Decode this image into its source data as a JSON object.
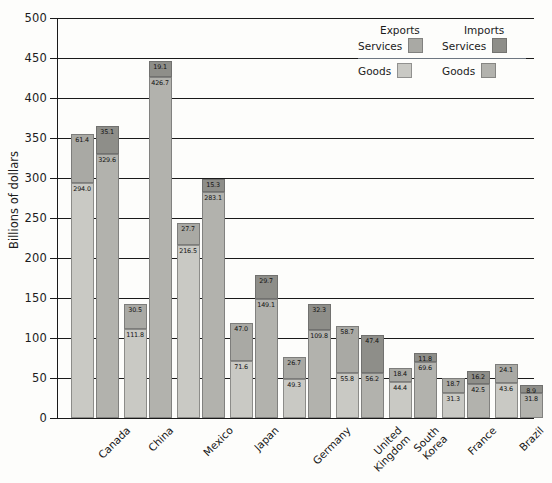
{
  "chart_data": {
    "type": "bar",
    "subtype": "grouped-stacked-bar",
    "title": "",
    "xlabel": "",
    "ylabel": "Billions of dollars",
    "ylim": [
      0,
      500
    ],
    "ytick_step": 50,
    "yticks": [
      0,
      50,
      100,
      150,
      200,
      250,
      300,
      350,
      400,
      450,
      500
    ],
    "ytick_labels": [
      "0",
      "50",
      "100",
      "150",
      "200",
      "250",
      "300",
      "350",
      "400",
      "450",
      "500"
    ],
    "grid": true,
    "grid_axis": "y",
    "legend_position": "top-right",
    "categories": [
      "Canada",
      "China",
      "Mexico",
      "Japan",
      "Germany",
      "United\nKingdom",
      "South\nKorea",
      "France",
      "Brazil"
    ],
    "series": [
      {
        "name": "Exports Goods",
        "group": "Exports",
        "part": "Goods",
        "color": "#c9c9c4",
        "values": [
          294.0,
          111.8,
          216.5,
          71.6,
          49.3,
          55.8,
          44.4,
          31.3,
          43.6
        ]
      },
      {
        "name": "Exports Services",
        "group": "Exports",
        "part": "Services",
        "color": "#a9a9a4",
        "values": [
          61.4,
          30.5,
          27.7,
          47.0,
          26.7,
          58.7,
          18.4,
          18.7,
          24.1
        ]
      },
      {
        "name": "Imports Goods",
        "group": "Imports",
        "part": "Goods",
        "color": "#b2b2ad",
        "values": [
          329.6,
          426.7,
          283.1,
          149.1,
          109.8,
          56.2,
          69.6,
          42.5,
          31.8
        ]
      },
      {
        "name": "Imports Services",
        "group": "Imports",
        "part": "Services",
        "color": "#8e8e89",
        "values": [
          35.1,
          19.1,
          15.3,
          29.7,
          32.3,
          47.4,
          11.8,
          16.2,
          8.9
        ]
      }
    ],
    "data_labels": {
      "Canada": {
        "exports_goods": "294.0",
        "exports_services": "61.4",
        "imports_goods": "329.6",
        "imports_services": "35.1"
      },
      "China": {
        "exports_goods": "111.8",
        "exports_services": "30.5",
        "imports_goods": "426.7",
        "imports_services": "19.1"
      },
      "Mexico": {
        "exports_goods": "216.5",
        "exports_services": "27.7",
        "imports_goods": "283.1",
        "imports_services": "15.3"
      },
      "Japan": {
        "exports_goods": "71.6",
        "exports_services": "47.0",
        "imports_goods": "149.1",
        "imports_services": "29.7"
      },
      "Germany": {
        "exports_goods": "49.3",
        "exports_services": "26.7",
        "imports_goods": "109.8",
        "imports_services": "32.3"
      },
      "United Kingdom": {
        "exports_goods": "55.8",
        "exports_services": "58.7",
        "imports_goods": "56.2",
        "imports_services": "47.4"
      },
      "South Korea": {
        "exports_goods": "44.4",
        "exports_services": "18.4",
        "imports_goods": "69.6",
        "imports_services": "11.8"
      },
      "France": {
        "exports_goods": "31.3",
        "exports_services": "18.7",
        "imports_goods": "42.5",
        "imports_services": "16.2"
      },
      "Brazil": {
        "exports_goods": "43.6",
        "exports_services": "24.1",
        "imports_goods": "31.8",
        "imports_services": "8.9"
      }
    }
  },
  "legend": {
    "exports_header": "Exports",
    "imports_header": "Imports",
    "services_label_left": "Services",
    "services_label_right": "Services",
    "goods_label_left": "Goods",
    "goods_label_right": "Goods"
  },
  "colors": {
    "exports_goods": "#c9c9c4",
    "exports_services": "#a9a9a4",
    "imports_goods": "#b2b2ad",
    "imports_services": "#8e8e89",
    "axis": "#1a1a1a",
    "background": "#fdfdfb"
  }
}
